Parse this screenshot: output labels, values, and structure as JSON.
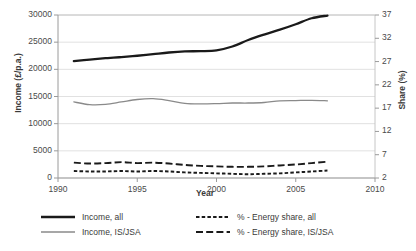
{
  "chart_data": {
    "type": "line",
    "title": "",
    "xlabel": "Year",
    "ylabel": "Income (£/p.a.)",
    "y2label": "Share (%)",
    "grid": true,
    "legend_position": "bottom",
    "xlim": [
      1990,
      2010
    ],
    "ylim": [
      0,
      30000
    ],
    "y2lim": [
      2,
      37
    ],
    "xticks": [
      "1990",
      "1995",
      "2000",
      "2005",
      "2010"
    ],
    "yticks": [
      "0",
      "5000",
      "10000",
      "15000",
      "20000",
      "25000",
      "30000"
    ],
    "y2ticks": [
      "2",
      "7",
      "12",
      "17",
      "22",
      "27",
      "32",
      "37"
    ],
    "x": [
      1991,
      1992,
      1993,
      1994,
      1995,
      1996,
      1997,
      1998,
      1999,
      2000,
      2001,
      2002,
      2003,
      2004,
      2005,
      2006,
      2007
    ],
    "series": [
      {
        "name": "Income, all",
        "axis": "left",
        "style": "solid-thick",
        "color": "#1a1a1a",
        "values": [
          21500,
          21800,
          22050,
          22250,
          22500,
          22800,
          23100,
          23300,
          23350,
          23500,
          24200,
          25400,
          26400,
          27300,
          28300,
          29400,
          29900
        ]
      },
      {
        "name": "Income, IS/JSA",
        "axis": "left",
        "style": "solid-thin",
        "color": "#8a8a8a",
        "values": [
          14000,
          13500,
          13550,
          14000,
          14450,
          14600,
          14250,
          13750,
          13650,
          13700,
          13800,
          13800,
          13900,
          14200,
          14250,
          14300,
          14200
        ]
      },
      {
        "name": "% - Energy share, all",
        "axis": "right",
        "style": "dotted",
        "color": "#1a1a1a",
        "values": [
          3.5,
          3.4,
          3.4,
          3.5,
          3.4,
          3.5,
          3.4,
          3.2,
          3.1,
          3.0,
          2.9,
          2.8,
          2.9,
          3.0,
          3.2,
          3.4,
          3.6
        ]
      },
      {
        "name": "% - Energy share, IS/JSA",
        "axis": "right",
        "style": "dashed",
        "color": "#1a1a1a",
        "values": [
          5.3,
          5.1,
          5.2,
          5.4,
          5.2,
          5.3,
          5.1,
          4.8,
          4.6,
          4.5,
          4.4,
          4.4,
          4.5,
          4.7,
          4.9,
          5.2,
          5.5
        ]
      }
    ]
  },
  "axes": {
    "y_left_title": "Income (£/p.a.)",
    "y_right_title": "Share (%)",
    "x_title": "Year"
  },
  "legend": {
    "items": [
      {
        "label": "Income, all",
        "style": "solid-thick",
        "color": "#1a1a1a"
      },
      {
        "label": "Income, IS/JSA",
        "style": "solid-thin",
        "color": "#8a8a8a"
      },
      {
        "label": "% - Energy share, all",
        "style": "dotted",
        "color": "#1a1a1a"
      },
      {
        "label": "% - Energy share, IS/JSA",
        "style": "dashed",
        "color": "#1a1a1a"
      }
    ]
  }
}
